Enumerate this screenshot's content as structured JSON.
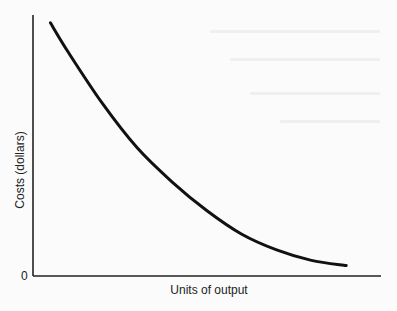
{
  "chart_data": {
    "type": "line",
    "title": "",
    "xlabel": "Units of output",
    "ylabel": "Costs (dollars)",
    "origin_label": "0",
    "grid": false,
    "legend": null,
    "series": [
      {
        "name": "Average fixed cost curve",
        "shape": "decreasing convex (hyperbolic)",
        "x": [
          0.05,
          0.1,
          0.2,
          0.3,
          0.4,
          0.5,
          0.6,
          0.7,
          0.8,
          0.9
        ],
        "y": [
          0.97,
          0.86,
          0.66,
          0.49,
          0.36,
          0.25,
          0.16,
          0.1,
          0.06,
          0.04
        ]
      }
    ],
    "xlim": [
      0,
      1
    ],
    "ylim": [
      0,
      1
    ],
    "colors": {
      "curve": "#111111",
      "axes": "#222222"
    }
  }
}
